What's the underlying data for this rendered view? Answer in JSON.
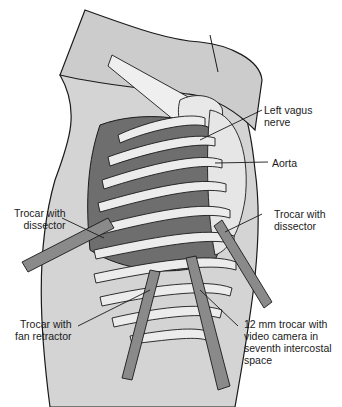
{
  "figure": {
    "colors": {
      "skin": "#d4d4d4",
      "arm": "#c8c8c8",
      "ribs": "#ececec",
      "lung_dark": "#6e6e6e",
      "aorta": "#e6e6e6",
      "trocar": "#8a8a8a",
      "outline": "#1a1a1a"
    }
  },
  "labels": {
    "left_vagus_nerve": "Left vagus\nnerve",
    "aorta": "Aorta",
    "trocar_dissector_left": "Trocar with\ndissector",
    "trocar_dissector_right": "Trocar with\ndissector",
    "trocar_fan_retractor": "Trocar with\nfan retractor",
    "trocar_camera": "12 mm trocar with\nvideo camera in\nseventh intercostal\nspace"
  }
}
